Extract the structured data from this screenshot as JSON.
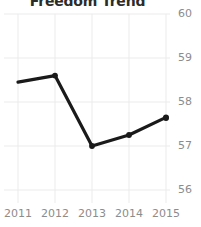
{
  "chart_data": {
    "type": "line",
    "title": "Freedom Trend",
    "xlabel": "",
    "ylabel": "",
    "categories": [
      "2011",
      "2012",
      "2013",
      "2014",
      "2015"
    ],
    "x": [
      2011,
      2012,
      2013,
      2014,
      2015
    ],
    "values": [
      58.45,
      58.6,
      57.0,
      57.25,
      57.65
    ],
    "series": [
      {
        "name": "Freedom Score",
        "values": [
          58.45,
          58.6,
          57.0,
          57.25,
          57.65
        ]
      }
    ],
    "ylim": [
      55.7,
      60.3
    ],
    "xlim": [
      2010.8,
      2015.2
    ],
    "y_ticks": [
      60,
      59,
      58,
      57,
      56
    ],
    "y_tick_labels": [
      "60",
      "59",
      "58",
      "57",
      "56"
    ],
    "x_ticks": [
      2011,
      2012,
      2013,
      2014,
      2015
    ],
    "x_tick_labels": [
      "2011",
      "2012",
      "2013",
      "2014",
      "2015"
    ],
    "grid": true,
    "grid_color": "#ebebeb",
    "legend": false,
    "legend_position": "none",
    "line_color": "#1a1a1a",
    "marker": "circle",
    "marker_color": "#1a1a1a",
    "y_axis_side": "right",
    "annotations": []
  }
}
